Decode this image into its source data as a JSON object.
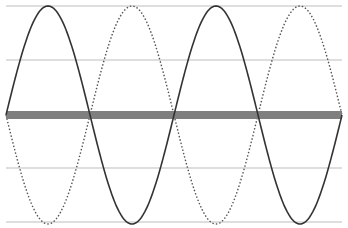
{
  "diagram": {
    "type": "standing-wave",
    "gridlines_y": [
      6,
      60,
      168,
      222
    ],
    "gridline_color": "#bdbdbd",
    "axis_band": {
      "y": 115,
      "thickness": 8,
      "color": "#7f7f7f"
    },
    "wave": {
      "x_start": 6,
      "x_end": 342,
      "center_y": 115,
      "amplitude": 109,
      "period_px": 168,
      "solid_color": "#333333",
      "dotted_color": "#555555"
    },
    "series": [
      {
        "name": "solid-wave",
        "style": "solid",
        "phase_sign": 1
      },
      {
        "name": "dotted-wave",
        "style": "dotted",
        "phase_sign": -1
      }
    ]
  }
}
